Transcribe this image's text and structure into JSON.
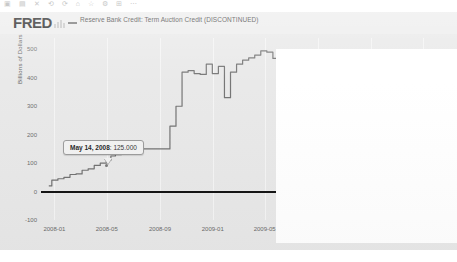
{
  "window": {
    "toolbar_glyphs": "▣ ▤ ✕ ⟲ ⟳ ⌂ ☆ ⚙ ⊞ ⋯"
  },
  "header": {
    "logo": "FRED",
    "logo_mark_icon": "fred-chart-mark-icon",
    "legend": [
      {
        "label": "Reserve Bank Credit: Term Auction Credit (DISCONTINUED)",
        "color": "#6f6f6f"
      }
    ]
  },
  "tooltip": {
    "date": "May 14, 2008",
    "separator": ": ",
    "value": "125.000"
  },
  "chart_data": {
    "type": "line",
    "title": "",
    "subtitle": "",
    "xlabel": "",
    "ylabel": "Billions of Dollars",
    "series_name": "Reserve Bank Credit: Term Auction Credit (DISCONTINUED)",
    "series_color": "#6f6f6f",
    "grid": false,
    "legend_position": "top",
    "ylim": [
      -100,
      540
    ],
    "y_ticks": [
      0,
      100,
      200,
      300,
      400,
      500
    ],
    "y_tick_labels": [
      "0",
      "100",
      "200",
      "300",
      "400",
      "500"
    ],
    "y_extra_label": "-100",
    "xlim": [
      "2007-12-01",
      "2010-07-01"
    ],
    "x_ticks": [
      "2008-01",
      "2008-05",
      "2008-09",
      "2009-01",
      "2009-05",
      "2009-09",
      "2010-01",
      "2010-05"
    ],
    "zero_line": 0,
    "annotation": {
      "x": "2008-05-14",
      "y": 125.0,
      "text": "May 14, 2008: 125.000"
    },
    "occlusion_overlay": {
      "note": "white rectangle covering right portion of plot in the capture",
      "x_start": "2009-06",
      "x_end": "2010-07"
    },
    "x": [
      "2007-12-19",
      "2008-01-02",
      "2008-01-16",
      "2008-01-30",
      "2008-02-13",
      "2008-02-27",
      "2008-03-12",
      "2008-03-26",
      "2008-04-09",
      "2008-04-23",
      "2008-05-07",
      "2008-05-14",
      "2008-05-28",
      "2008-06-11",
      "2008-06-25",
      "2008-07-09",
      "2008-07-23",
      "2008-08-06",
      "2008-08-20",
      "2008-09-03",
      "2008-09-17",
      "2008-10-01",
      "2008-10-15",
      "2008-10-29",
      "2008-11-12",
      "2008-11-26",
      "2008-12-10",
      "2008-12-24",
      "2009-01-07",
      "2009-01-21",
      "2009-02-04",
      "2009-02-18",
      "2009-03-04",
      "2009-03-18",
      "2009-04-01",
      "2009-04-15",
      "2009-04-29",
      "2009-05-13",
      "2009-05-27",
      "2009-06-10",
      "2009-06-24",
      "2009-07-08",
      "2009-07-22",
      "2009-08-05",
      "2009-08-19",
      "2009-09-02",
      "2009-09-16",
      "2009-09-30",
      "2009-10-14",
      "2009-10-28",
      "2009-11-11",
      "2009-11-25",
      "2009-12-09",
      "2009-12-23",
      "2010-01-06",
      "2010-01-20",
      "2010-02-03",
      "2010-02-17",
      "2010-03-03",
      "2010-03-17",
      "2010-03-31",
      "2010-04-14",
      "2010-04-28",
      "2010-05-12",
      "2010-05-26",
      "2010-06-09",
      "2010-06-23"
    ],
    "values": [
      20,
      40,
      45,
      50,
      60,
      62,
      75,
      80,
      92,
      100,
      110,
      125,
      130,
      145,
      148,
      150,
      150,
      150,
      150,
      150,
      150,
      230,
      300,
      420,
      425,
      415,
      412,
      448,
      415,
      440,
      330,
      420,
      448,
      462,
      470,
      480,
      495,
      490,
      468,
      466,
      465,
      440,
      430,
      452,
      440,
      420,
      365,
      320,
      290,
      260,
      230,
      205,
      180,
      160,
      135,
      110,
      85,
      58,
      40,
      22,
      8,
      0,
      0,
      0,
      0,
      0,
      0
    ]
  }
}
